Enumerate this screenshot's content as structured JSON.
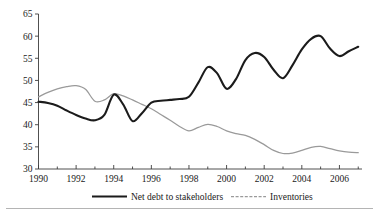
{
  "chart_data": {
    "type": "line",
    "title": "",
    "subtitle": "",
    "xlabel": "",
    "ylabel": "",
    "xlim": [
      1990,
      2007.2
    ],
    "ylim": [
      30,
      65
    ],
    "grid": false,
    "legend_position": "bottom",
    "yticks": [
      30,
      35,
      40,
      45,
      50,
      55,
      60,
      65
    ],
    "ytick_labels": [
      "30",
      "35",
      "40",
      "45",
      "50",
      "55",
      "60",
      "65"
    ],
    "xticks": [
      1990,
      1992,
      1994,
      1996,
      1998,
      2000,
      2002,
      2004,
      2006
    ],
    "xtick_labels": [
      "1990",
      "1992",
      "1994",
      "1996",
      "1998",
      "2000",
      "2002",
      "2004",
      "2006"
    ],
    "xticks_minor": [
      1991,
      1993,
      1995,
      1997,
      1999,
      2001,
      2003,
      2005,
      2007
    ],
    "x": [
      1990,
      1990.5,
      1991,
      1991.5,
      1992,
      1992.5,
      1993,
      1993.5,
      1994,
      1994.5,
      1995,
      1995.5,
      1996,
      1996.5,
      1997,
      1997.5,
      1998,
      1998.5,
      1999,
      1999.5,
      2000,
      2000.5,
      2001,
      2001.5,
      2002,
      2002.5,
      2003,
      2003.5,
      2004,
      2004.5,
      2005,
      2005.5,
      2006,
      2006.5,
      2007
    ],
    "series": [
      {
        "name": "Net debt to stakeholders",
        "color": "#1b1b1b",
        "style": "solid-thick",
        "values": [
          45.2,
          44.9,
          44.3,
          43.2,
          42.2,
          41.4,
          41.0,
          42.2,
          46.8,
          44.6,
          40.8,
          42.6,
          45.0,
          45.4,
          45.6,
          45.8,
          46.3,
          49.5,
          53.0,
          51.6,
          48.1,
          50.3,
          54.6,
          56.2,
          55.3,
          52.4,
          50.5,
          53.4,
          57.0,
          59.4,
          60.0,
          57.2,
          55.5,
          56.6,
          57.6
        ]
      },
      {
        "name": "Inventories",
        "color": "#9a9a9a",
        "style": "solid-thin",
        "values": [
          46.3,
          47.3,
          48.1,
          48.6,
          48.8,
          48.0,
          45.3,
          45.6,
          47.0,
          46.5,
          45.6,
          44.6,
          43.6,
          42.3,
          41.0,
          39.6,
          38.6,
          39.4,
          40.1,
          39.6,
          38.6,
          38.0,
          37.6,
          36.7,
          35.5,
          34.2,
          33.5,
          33.6,
          34.2,
          34.9,
          35.1,
          34.6,
          34.1,
          33.8,
          33.7
        ]
      }
    ],
    "annotations": []
  },
  "legend": {
    "items": [
      {
        "label": "Net debt to stakeholders"
      },
      {
        "label": "Inventories"
      }
    ]
  }
}
